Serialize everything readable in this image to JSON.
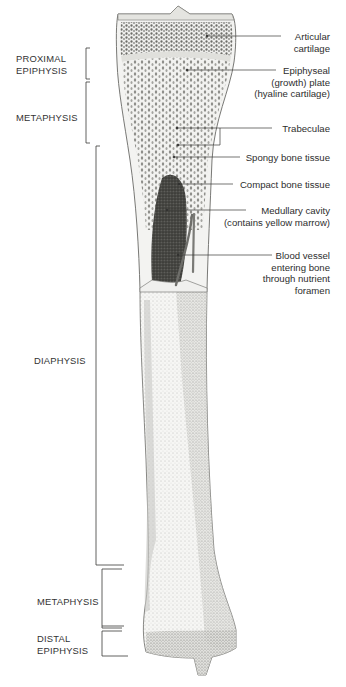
{
  "figure": {
    "colors": {
      "ink": "#2e2e2e",
      "bone_fill": "#f4f4f2",
      "cartilage": "#e6e6e3",
      "spongy": "#9a9a96",
      "marrow": "#3a3a38",
      "vessel": "#7a7a78"
    }
  },
  "regions": [
    {
      "id": "proximal-epiphysis",
      "lines": [
        "PROXIMAL",
        "EPIPHYSIS"
      ],
      "bracket": [
        48,
        79
      ]
    },
    {
      "id": "proximal-metaphysis",
      "lines": [
        "METAPHYSIS"
      ],
      "bracket": [
        82,
        143
      ]
    },
    {
      "id": "diaphysis",
      "lines": [
        "DIAPHYSIS"
      ],
      "bracket": [
        146,
        565
      ]
    },
    {
      "id": "distal-metaphysis",
      "lines": [
        "METAPHYSIS"
      ],
      "bracket": [
        569,
        628
      ]
    },
    {
      "id": "distal-epiphysis",
      "lines": [
        "DISTAL",
        "EPIPHYSIS"
      ],
      "bracket": [
        631,
        656
      ]
    }
  ],
  "callouts": [
    {
      "id": "articular-cartilage",
      "lines": [
        "Articular",
        "cartilage"
      ]
    },
    {
      "id": "epiphyseal-plate",
      "lines": [
        "Epiphyseal",
        "(growth) plate",
        "(hyaline cartilage)"
      ]
    },
    {
      "id": "trabeculae",
      "lines": [
        "Trabeculae"
      ]
    },
    {
      "id": "spongy-bone",
      "lines": [
        "Spongy bone tissue"
      ]
    },
    {
      "id": "compact-bone",
      "lines": [
        "Compact bone tissue"
      ]
    },
    {
      "id": "medullary-cavity",
      "lines": [
        "Medullary cavity",
        "(contains yellow marrow)"
      ]
    },
    {
      "id": "blood-vessel",
      "lines": [
        "Blood vessel",
        "entering bone",
        "through nutrient",
        "foramen"
      ]
    }
  ]
}
